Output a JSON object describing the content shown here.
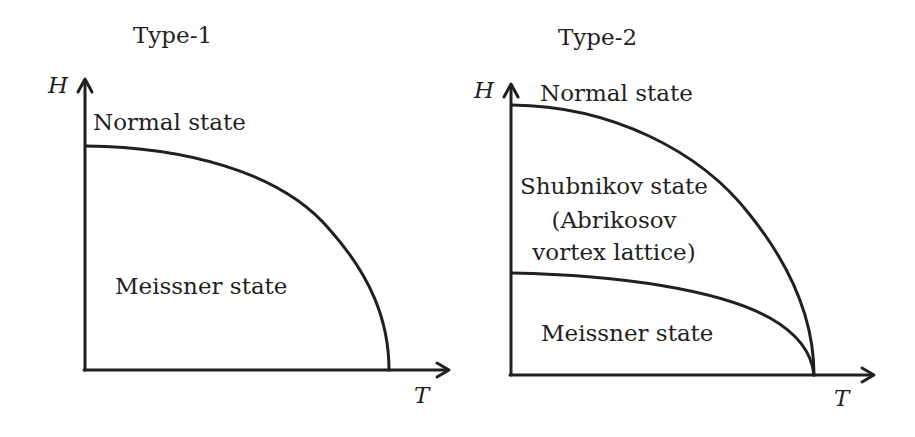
{
  "panels": [
    {
      "title": "Type-1",
      "y_axis_label": "H",
      "x_axis_label": "T",
      "regions": {
        "upper": "Normal state",
        "lower": "Meissner state"
      },
      "curves": [
        "Hc(T) critical field boundary"
      ]
    },
    {
      "title": "Type-2",
      "y_axis_label": "H",
      "x_axis_label": "T",
      "regions": {
        "upper": "Normal state",
        "middle_line1": "Shubnikov state",
        "middle_line2": "(Abrikosov",
        "middle_line3": "vortex lattice)",
        "lower": "Meissner state"
      },
      "curves": [
        "Hc2(T) upper critical field boundary",
        "Hc1(T) lower critical field boundary"
      ]
    }
  ],
  "colors": {
    "ink": "#231f20",
    "background": "#ffffff"
  }
}
